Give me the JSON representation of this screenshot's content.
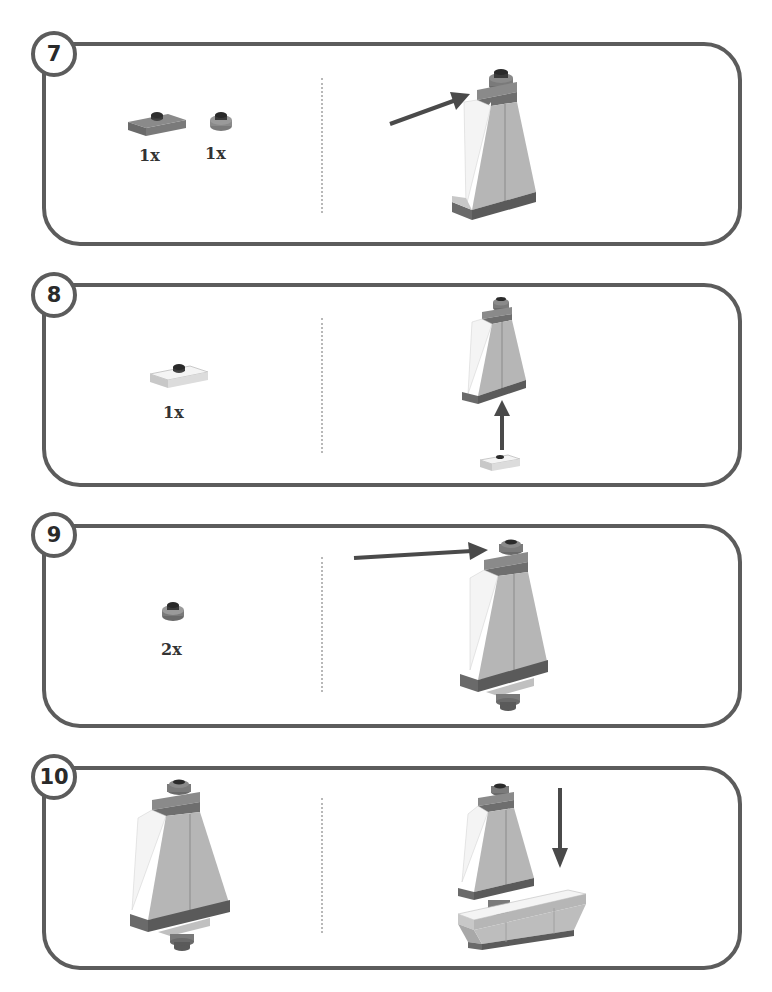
{
  "page": {
    "type": "building-instructions",
    "colors": {
      "frame": "#5c5c5c",
      "dark_grey_brick": "#6e6e6e",
      "light_grey_brick": "#b4b4b4",
      "white_brick": "#f2f2f2",
      "arrow": "#4a4a4a",
      "divider": "#b8b8b8"
    }
  },
  "steps": [
    {
      "number": "7",
      "parts": [
        {
          "name": "plate-1x2-jumper-dark-grey",
          "qty": "1x"
        },
        {
          "name": "round-plate-1x1-dark-grey",
          "qty": "1x"
        }
      ],
      "assembly": {
        "arrow_direction": "right-up"
      }
    },
    {
      "number": "8",
      "parts": [
        {
          "name": "plate-1x2-jumper-white",
          "qty": "1x"
        }
      ],
      "assembly": {
        "arrow_direction": "up"
      }
    },
    {
      "number": "9",
      "parts": [
        {
          "name": "round-plate-1x1-dark-grey",
          "qty": "2x"
        }
      ],
      "assembly": {
        "arrow_direction": "right"
      }
    },
    {
      "number": "10",
      "parts": [],
      "assembly": {
        "arrow_direction": "down"
      }
    }
  ]
}
